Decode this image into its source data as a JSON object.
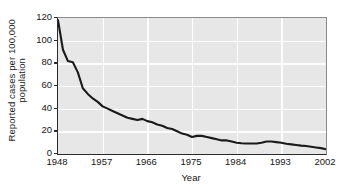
{
  "chart_data": {
    "type": "line",
    "title": "",
    "xlabel": "Year",
    "ylabel": "Reported cases per 100,000 population",
    "ylabel_line1": "Reported cases per 100,000",
    "ylabel_line2": "population",
    "xlim": [
      1948,
      2002
    ],
    "ylim": [
      0,
      120
    ],
    "grid": true,
    "legend": "none",
    "xticks": [
      1948,
      1957,
      1966,
      1975,
      1984,
      1993,
      2002
    ],
    "xtick_labels": [
      "1948",
      "1957",
      "1966",
      "1975",
      "1984",
      "1993",
      "2002"
    ],
    "yticks": [
      0,
      20,
      40,
      60,
      80,
      100,
      120
    ],
    "ytick_labels": [
      "0",
      "20",
      "40",
      "60",
      "80",
      "100",
      "120"
    ],
    "series": [
      {
        "name": "Reported cases per 100,000 population",
        "color": "#1a1a1a",
        "x": [
          1948,
          1949,
          1950,
          1951,
          1952,
          1953,
          1954,
          1955,
          1956,
          1957,
          1958,
          1959,
          1960,
          1961,
          1962,
          1963,
          1964,
          1965,
          1966,
          1967,
          1968,
          1969,
          1970,
          1971,
          1972,
          1973,
          1974,
          1975,
          1976,
          1977,
          1978,
          1979,
          1980,
          1981,
          1982,
          1983,
          1984,
          1985,
          1986,
          1987,
          1988,
          1989,
          1990,
          1991,
          1992,
          1993,
          1994,
          1995,
          1996,
          1997,
          1998,
          1999,
          2000,
          2001,
          2002
        ],
        "y": [
          118,
          92,
          82,
          81,
          72,
          58,
          53,
          49,
          46,
          42,
          40,
          38,
          36,
          34,
          32,
          31,
          30,
          31,
          29,
          28,
          26,
          25,
          23,
          22,
          20,
          18,
          17,
          15,
          16,
          16,
          15,
          14,
          13,
          12,
          12,
          11,
          10,
          9.5,
          9.3,
          9.2,
          9.3,
          10,
          11,
          11,
          10.5,
          10,
          9,
          8.5,
          8,
          7.4,
          7,
          6.4,
          5.8,
          5.2,
          4.2
        ]
      }
    ],
    "colors": {
      "plot_background": "#e7e7e7",
      "gridline": "#fdfdfd",
      "line": "#1a1a1a",
      "axis": "#2b2b2b",
      "text": "#161616",
      "page_background": "#ffffff"
    }
  }
}
